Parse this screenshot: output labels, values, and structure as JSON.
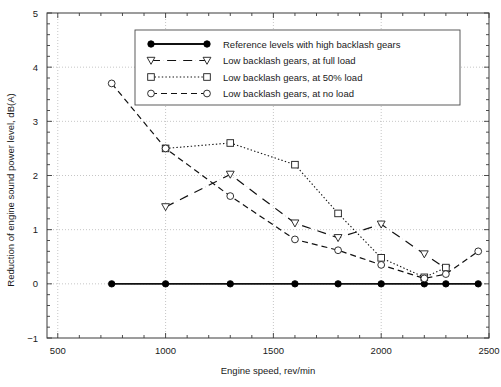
{
  "chart_data": {
    "type": "line",
    "title": "",
    "xlabel": "Engine speed, rev/min",
    "ylabel": "Reduction of engine sound power level, dB(A)",
    "xlim": [
      450,
      2500
    ],
    "ylim": [
      -1,
      5
    ],
    "x_ticks": [
      500,
      1000,
      1500,
      2000,
      2500
    ],
    "x_tick_labels": [
      "500",
      "1000",
      "1500",
      "2000",
      "2500"
    ],
    "x_minor_step": 100,
    "y_ticks": [
      -1,
      0,
      1,
      2,
      3,
      4,
      5
    ],
    "y_tick_labels": [
      "−1",
      "0",
      "1",
      "2",
      "3",
      "4",
      "5"
    ],
    "y_minor_step": 0.2,
    "grid": "dotted gridlines at major x and y ticks",
    "legend_position": "upper center",
    "series": [
      {
        "name": "Reference levels with high backlash gears",
        "marker": "filled-circle",
        "linestyle": "solid",
        "linewidth": 1.8,
        "x": [
          750,
          1000,
          1300,
          1600,
          1800,
          2000,
          2200,
          2300,
          2450
        ],
        "values": [
          0,
          0,
          0,
          0,
          0,
          0,
          0,
          0,
          0
        ]
      },
      {
        "name": "Low backlash gears, at full load",
        "marker": "down-triangle",
        "linestyle": "dashdot",
        "linewidth": 1.2,
        "x": [
          1000,
          1300,
          1600,
          1800,
          2000,
          2200,
          2300
        ],
        "values": [
          1.42,
          2.02,
          1.12,
          0.85,
          1.1,
          0.55,
          0.28
        ]
      },
      {
        "name": "Low backlash gears, at 50% load",
        "marker": "open-square",
        "linestyle": "dotted",
        "linewidth": 1.1,
        "x": [
          1000,
          1300,
          1600,
          1800,
          2000,
          2200,
          2300
        ],
        "values": [
          2.5,
          2.6,
          2.2,
          1.3,
          0.48,
          0.12,
          0.3
        ]
      },
      {
        "name": "Low backlash gears, at no load",
        "marker": "open-circle",
        "linestyle": "dashed",
        "linewidth": 1.2,
        "x": [
          750,
          1000,
          1300,
          1600,
          1800,
          2000,
          2200,
          2300,
          2450
        ],
        "values": [
          3.7,
          2.5,
          1.62,
          0.82,
          0.62,
          0.35,
          0.1,
          0.18,
          0.6
        ]
      }
    ]
  },
  "legend": {
    "entries": [
      "Reference levels with high backlash gears",
      "Low backlash gears, at full load",
      "Low backlash gears, at 50% load",
      "Low backlash gears, at no load"
    ]
  }
}
